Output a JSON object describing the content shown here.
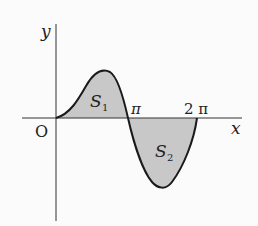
{
  "diagram": {
    "type": "function-graph",
    "axes": {
      "x_label": "x",
      "y_label": "y",
      "origin_label": "O"
    },
    "x_ticks": [
      {
        "label": "π"
      },
      {
        "label": "2 π"
      }
    ],
    "regions": [
      {
        "name": "S1",
        "label_main": "S",
        "label_sub": "1",
        "position": "above x-axis, 0 to π"
      },
      {
        "name": "S2",
        "label_main": "S",
        "label_sub": "2",
        "position": "below x-axis, π to 2π"
      }
    ],
    "colors": {
      "fill": "#c8c8c8",
      "curve": "#1a1a1a",
      "axis": "#333333"
    }
  }
}
